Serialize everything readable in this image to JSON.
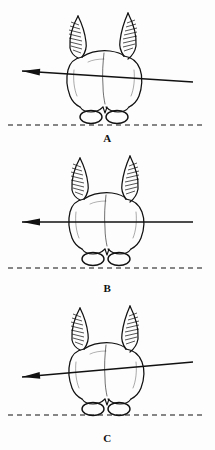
{
  "figure": {
    "type": "anatomical-line-drawing",
    "width": 215,
    "height": 450,
    "background_color": "#fdfdfd",
    "ink_color": "#111111",
    "panel_count": 3,
    "top_bleed_text": "",
    "bottom_caption_partial": ""
  },
  "panels": [
    {
      "id": "A",
      "label": "A",
      "axis": {
        "name": "reference-axis-line",
        "arrow_direction": "left",
        "x1": 22,
        "y1": 71,
        "x2": 193,
        "y2": 82,
        "slope_description": "tilted down to the right",
        "angle_degrees": 3.7,
        "stroke_width": 1.3,
        "color": "#111111"
      },
      "baseline": {
        "name": "joint-baseline",
        "style": "dashed",
        "y": 125,
        "x_start": 8,
        "x_end": 205,
        "dash": "5 4",
        "color": "#111111"
      },
      "bone": {
        "name": "distal-femur",
        "condyle_count": 2,
        "shaft_processes": 2,
        "hatching": true
      }
    },
    {
      "id": "B",
      "label": "B",
      "axis": {
        "name": "reference-axis-line",
        "arrow_direction": "left",
        "x1": 22,
        "y1": 72,
        "x2": 193,
        "y2": 72,
        "slope_description": "horizontal, parallel to baseline",
        "angle_degrees": 0,
        "stroke_width": 1.3,
        "color": "#111111"
      },
      "baseline": {
        "name": "joint-baseline",
        "style": "dashed",
        "y": 118,
        "x_start": 8,
        "x_end": 205,
        "dash": "5 4",
        "color": "#111111"
      },
      "bone": {
        "name": "distal-femur",
        "condyle_count": 2,
        "shaft_processes": 2,
        "hatching": true
      }
    },
    {
      "id": "C",
      "label": "C",
      "axis": {
        "name": "reference-axis-line",
        "arrow_direction": "left",
        "x1": 22,
        "y1": 77,
        "x2": 193,
        "y2": 62,
        "slope_description": "tilted up to the right",
        "angle_degrees": -5.0,
        "stroke_width": 1.3,
        "color": "#111111"
      },
      "baseline": {
        "name": "joint-baseline",
        "style": "dashed",
        "y": 115,
        "x_start": 8,
        "x_end": 205,
        "dash": "5 4",
        "color": "#111111"
      },
      "bone": {
        "name": "distal-femur",
        "condyle_count": 2,
        "shaft_processes": 2,
        "hatching": true
      }
    }
  ]
}
